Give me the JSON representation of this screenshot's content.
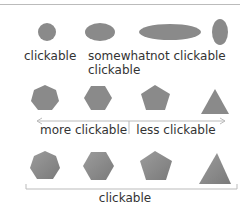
{
  "row1": {
    "labels": [
      "clickable",
      "somewhat\nclickable",
      "not clickable"
    ],
    "label_clickable": "clickable",
    "label_somewhat_1": "somewhat",
    "label_somewhat_2": "clickable",
    "label_not": "not clickable"
  },
  "row2": {
    "left_label": "more clickable",
    "right_label": "less clickable"
  },
  "row3": {
    "label": "clickable"
  },
  "colors": {
    "shape_fill": "#8a8a8a",
    "shape_fill_light": "#a3a3a3",
    "line": "#bbbbbb",
    "text": "#333333"
  }
}
